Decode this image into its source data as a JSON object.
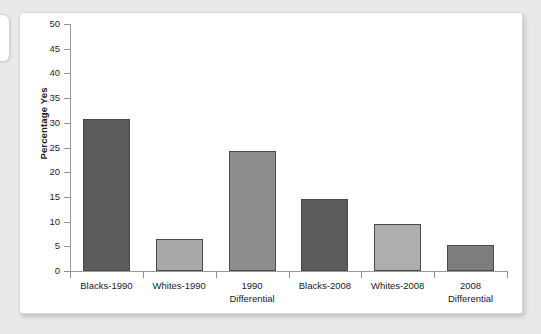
{
  "figure": {
    "background_color": "#ffffff",
    "page_background_color": "#e9e9e9"
  },
  "chart_data": {
    "type": "bar",
    "title": "",
    "xlabel": "",
    "ylabel": "Percentage Yes",
    "categories": [
      "Blacks-1990",
      "Whites-1990",
      "1990 Differential",
      "Blacks-2008",
      "Whites-2008",
      "2008 Differential"
    ],
    "category_lines": [
      [
        "Blacks-1990",
        ""
      ],
      [
        "Whites-1990",
        ""
      ],
      [
        "1990",
        "Differential"
      ],
      [
        "Blacks-2008",
        ""
      ],
      [
        "Whites-2008",
        ""
      ],
      [
        "2008",
        "Differential"
      ]
    ],
    "values": [
      30.7,
      6.5,
      24.3,
      14.6,
      9.6,
      5.2
    ],
    "bar_colors": [
      "#5b5b5b",
      "#a9a9a9",
      "#8d8d8d",
      "#5b5b5b",
      "#aeaeae",
      "#7d7d7d"
    ],
    "ylim": [
      0,
      50
    ],
    "yticks": [
      0,
      5,
      10,
      15,
      20,
      25,
      30,
      35,
      40,
      45,
      50
    ],
    "ytick_labels": [
      "0",
      "5",
      "10",
      "15",
      "20",
      "25",
      "30",
      "35",
      "40",
      "45",
      "50"
    ],
    "grid": false,
    "legend": "none",
    "legend_position": "none"
  }
}
